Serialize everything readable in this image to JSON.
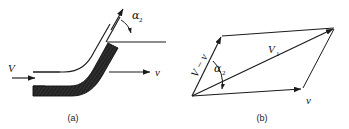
{
  "figure": {
    "title": "",
    "panels": [
      {
        "id": "a",
        "caption": "(a)",
        "name": "curved-vane-diagram",
        "labels": {
          "inlet_velocity": "V",
          "vane_velocity": "v",
          "exit_angle": "α",
          "exit_angle_subscript": "2"
        }
      },
      {
        "id": "b",
        "caption": "(b)",
        "name": "velocity-parallelogram-diagram",
        "labels": {
          "relative_velocity": "V − v",
          "absolute_velocity": "V",
          "absolute_velocity_subscript": "1",
          "blade_velocity": "v",
          "angle": "α",
          "angle_subscript": "2"
        }
      }
    ],
    "colors": {
      "ink": "#1a1a1a",
      "vane_fill": "#2b2b2b",
      "background": "#ffffff"
    }
  }
}
